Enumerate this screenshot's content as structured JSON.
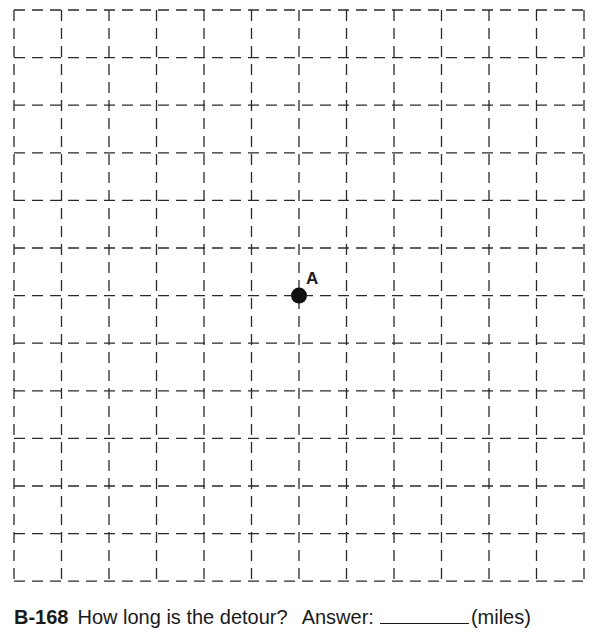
{
  "grid": {
    "columns": 12,
    "rows": 12,
    "left": 14,
    "top": 10,
    "cell_width": 47.5,
    "cell_height": 47.6,
    "line_color": "#2a2a2a",
    "style": "dashed"
  },
  "points": [
    {
      "label": "A",
      "col": 6,
      "row": 6,
      "color": "#111111"
    }
  ],
  "caption": {
    "number": "B-168",
    "question": "How long is the detour?",
    "answer_label": "Answer:",
    "unit": "(miles)"
  }
}
